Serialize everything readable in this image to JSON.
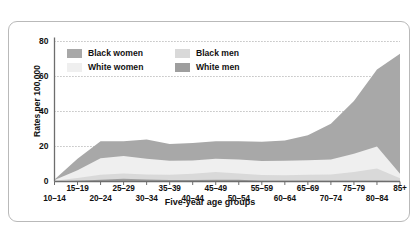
{
  "chart_data": {
    "type": "area",
    "stacked": true,
    "title": "",
    "subtitle": "",
    "xlabel": "Five-year age groups",
    "ylabel": "Rates per 100,000",
    "categories": [
      "10–14",
      "15–19",
      "20–24",
      "25–29",
      "30–34",
      "35–39",
      "40–44",
      "45–49",
      "50–54",
      "55–59",
      "60–64",
      "65–69",
      "70–74",
      "75–79",
      "80–84",
      "85+"
    ],
    "yticks": [
      0,
      20,
      40,
      60,
      80
    ],
    "ylim": [
      0,
      80
    ],
    "grid": true,
    "grid_style": "dotted",
    "legend_position": "top-left-inside",
    "series": [
      {
        "name": "White men",
        "color": "#9e9e9e",
        "values": [
          0.2,
          0.5,
          1.0,
          1.6,
          1.2,
          0.9,
          0.9,
          1.0,
          1.0,
          0.5,
          0.4,
          0.4,
          0.4,
          0.4,
          0.4,
          0.3
        ]
      },
      {
        "name": "Black men",
        "color": "#d9d9d9",
        "values": [
          0.3,
          1.5,
          2.8,
          3.0,
          2.8,
          3.0,
          3.6,
          4.5,
          3.6,
          3.2,
          3.2,
          3.4,
          3.6,
          5.0,
          7.0,
          1.5
        ]
      },
      {
        "name": "White women",
        "color": "#efefef",
        "values": [
          0.3,
          4.5,
          9.5,
          10.0,
          9.0,
          8.0,
          7.5,
          7.5,
          8.0,
          8.0,
          8.2,
          8.4,
          8.6,
          10.5,
          12.6,
          2.6
        ]
      },
      {
        "name": "Black women",
        "color": "#a8a8a8",
        "values": [
          0.4,
          6.5,
          9.7,
          8.4,
          11.0,
          9.5,
          10.0,
          10.0,
          10.4,
          11.0,
          11.7,
          14.2,
          20.4,
          30.1,
          44.0,
          68.6
        ]
      }
    ],
    "series_order_bottom_to_top": [
      "White men",
      "Black men",
      "White women",
      "Black women"
    ]
  },
  "legend": {
    "items": [
      {
        "label": "Black women",
        "color": "#a8a8a8"
      },
      {
        "label": "White women",
        "color": "#efefef"
      },
      {
        "label": "Black men",
        "color": "#d9d9d9"
      },
      {
        "label": "White men",
        "color": "#9e9e9e"
      }
    ]
  },
  "axes": {
    "y_label": "Rates per 100,000",
    "x_label": "Five-year age groups",
    "y_ticks": [
      "0",
      "20",
      "40",
      "60",
      "80"
    ],
    "x_ticks": [
      "10–14",
      "15–19",
      "20–24",
      "25–29",
      "30–34",
      "35–39",
      "40–44",
      "45–49",
      "50–54",
      "55–59",
      "60–64",
      "65–69",
      "70–74",
      "75–79",
      "80–84",
      "85+"
    ]
  },
  "colors": {
    "axis": "#6d6d6d",
    "text": "#111111",
    "frame": "#b9b9b9",
    "grid": "#8a8a8a",
    "background": "#ffffff"
  }
}
